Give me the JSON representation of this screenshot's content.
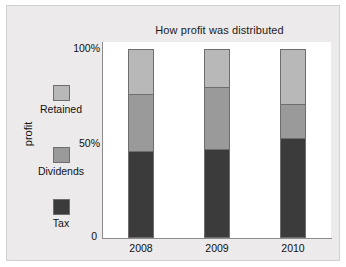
{
  "chart_data": {
    "type": "bar",
    "subtype": "stacked-percentage-column",
    "title": "How profit was distributed",
    "xlabel": "",
    "ylabel": "profit",
    "categories": [
      "2008",
      "2009",
      "2010"
    ],
    "ylim": [
      0,
      100
    ],
    "yticks": [
      0,
      50,
      100
    ],
    "ytick_labels": [
      "0",
      "50%",
      "100%"
    ],
    "grid": false,
    "legend_position": "left",
    "series": [
      {
        "name": "Tax",
        "color": "#3b3b3b",
        "values": [
          46,
          47,
          53
        ]
      },
      {
        "name": "Dividends",
        "color": "#9a9a9a",
        "values": [
          30,
          33,
          18
        ]
      },
      {
        "name": "Retained",
        "color": "#b8b8b8",
        "values": [
          24,
          20,
          29
        ]
      }
    ],
    "cumulative_tops": {
      "Tax": [
        46,
        47,
        53
      ],
      "Dividends": [
        76,
        80,
        71
      ],
      "Retained": [
        100,
        100,
        100
      ]
    }
  },
  "colors": {
    "panel_background": "#eceaea",
    "plot_background": "#ffffff",
    "axis": "#8d8b8b",
    "text": "#111111",
    "tax": "#3b3b3b",
    "dividends": "#9a9a9a",
    "retained": "#b8b8b8",
    "swatch_border": "#6f6d6d"
  },
  "legend": {
    "entries": [
      {
        "label": "Retained",
        "color": "#b8b8b8"
      },
      {
        "label": "Dividends",
        "color": "#9a9a9a"
      },
      {
        "label": "Tax",
        "color": "#3b3b3b"
      }
    ]
  },
  "axes": {
    "y_title": "profit",
    "y_tick_top": "100%",
    "y_tick_mid": "50%",
    "y_tick_zero": "0",
    "x_labels": [
      "2008",
      "2009",
      "2010"
    ]
  }
}
